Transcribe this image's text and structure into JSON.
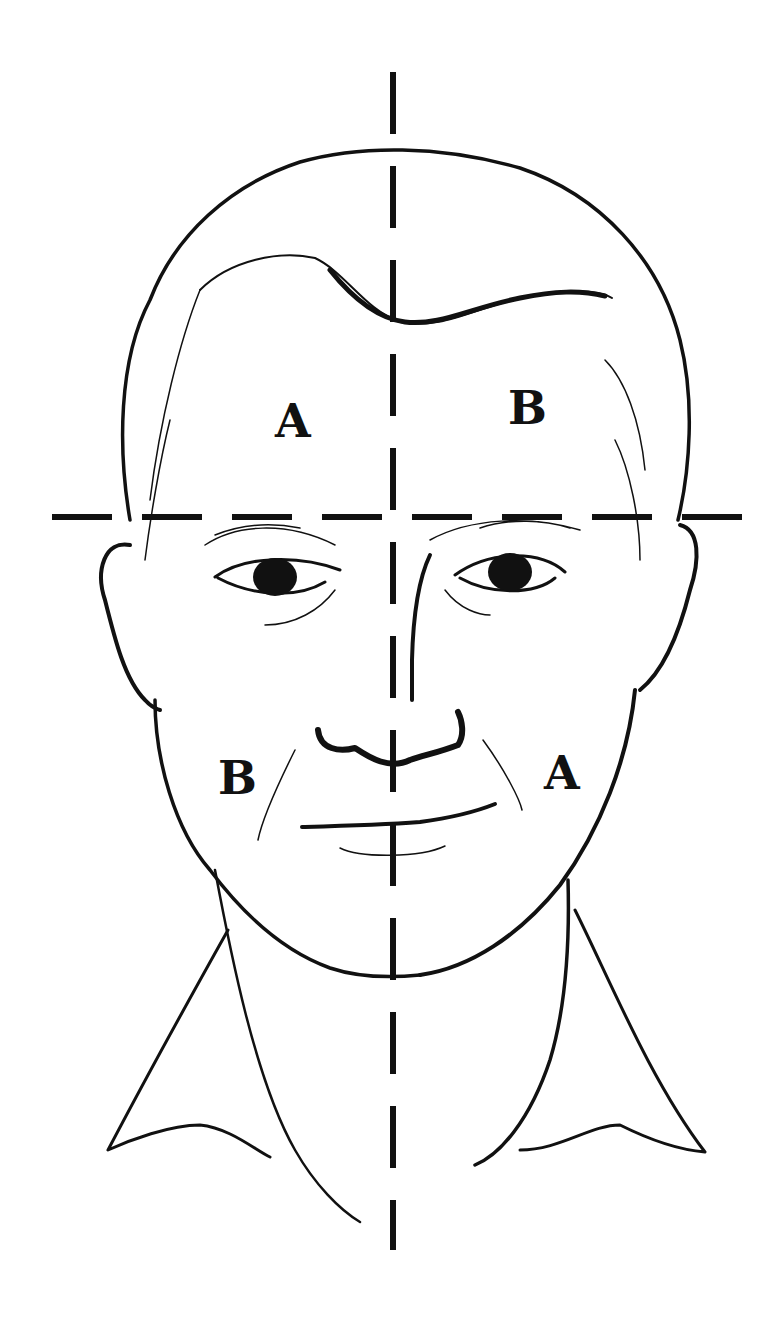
{
  "figure": {
    "ink_color": "#111111",
    "background": "#ffffff"
  },
  "guides": {
    "vertical_axis": {
      "style": "dashed",
      "x": 393,
      "y_start": 72,
      "y_end": 1250
    },
    "horizontal_axis": {
      "style": "dashed",
      "y": 517,
      "x_start": 52,
      "x_end": 742
    }
  },
  "quadrant_labels": {
    "upper_left": "A",
    "upper_right": "B",
    "lower_left": "B",
    "lower_right": "A"
  }
}
